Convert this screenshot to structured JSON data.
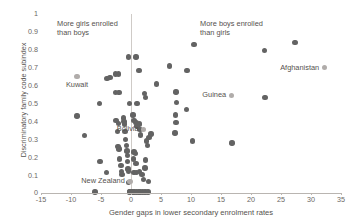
{
  "chart_data": {
    "type": "scatter",
    "title": "",
    "xlabel": "Gender gaps in lower secondary enrolment rates",
    "ylabel": "Discriminatory family code subindex",
    "xlim": [
      -15,
      35
    ],
    "ylim": [
      0,
      1
    ],
    "xticks": [
      -15,
      -10,
      -5,
      0,
      5,
      10,
      15,
      20,
      25,
      30,
      35
    ],
    "xtick_labels": [
      "-15",
      "-10",
      "-5",
      "0",
      "5",
      "10",
      "15",
      "20",
      "25",
      "30",
      "35"
    ],
    "yticks": [
      0,
      0.1,
      0.2,
      0.3,
      0.4,
      0.5,
      0.6,
      0.7,
      0.8,
      0.9,
      1
    ],
    "ytick_labels": [
      "0",
      "0.1",
      "0.2",
      "0.3",
      "0.4",
      "0.5",
      "0.6",
      "0.7",
      "0.8",
      "0.9",
      "1"
    ],
    "grid": false,
    "legend": null,
    "reference_lines": [
      {
        "name": "zero-gender-gap",
        "axis": "x",
        "value": 0
      }
    ],
    "annotations": [
      {
        "name": "more-girls-note",
        "text": "More girls enrolled\nthan boys",
        "x": -12.3,
        "y": 0.955
      },
      {
        "name": "more-boys-note",
        "text": "More boys enrolled\nthan girls",
        "x": 11.5,
        "y": 0.955
      }
    ],
    "point_color": "#636363",
    "label_point_color": "#b0acaa",
    "points": [
      {
        "x": -9.0,
        "y": 0.43
      },
      {
        "x": -7.8,
        "y": 0.32
      },
      {
        "x": -6.0,
        "y": 0.005
      },
      {
        "x": -5.3,
        "y": 0.5
      },
      {
        "x": -5.2,
        "y": 0.175
      },
      {
        "x": -4.0,
        "y": 0.64
      },
      {
        "x": -3.5,
        "y": 0.645
      },
      {
        "x": -4.1,
        "y": 0.115
      },
      {
        "x": -2.6,
        "y": 0.665
      },
      {
        "x": -2.1,
        "y": 0.665
      },
      {
        "x": -2.6,
        "y": 0.56
      },
      {
        "x": -2.0,
        "y": 0.56
      },
      {
        "x": -2.5,
        "y": 0.405
      },
      {
        "x": -2.1,
        "y": 0.39
      },
      {
        "x": -2.3,
        "y": 0.345
      },
      {
        "x": -2.2,
        "y": 0.26
      },
      {
        "x": -2.0,
        "y": 0.245
      },
      {
        "x": -1.9,
        "y": 0.19
      },
      {
        "x": -1.7,
        "y": 0.155
      },
      {
        "x": -1.6,
        "y": 0.12
      },
      {
        "x": -1.5,
        "y": 0.105
      },
      {
        "x": -1.3,
        "y": 0.42
      },
      {
        "x": -1.2,
        "y": 0.4
      },
      {
        "x": -1.1,
        "y": 0.385
      },
      {
        "x": -1.0,
        "y": 0.345
      },
      {
        "x": -0.9,
        "y": 0.3
      },
      {
        "x": -0.8,
        "y": 0.265
      },
      {
        "x": -0.7,
        "y": 0.235
      },
      {
        "x": -0.6,
        "y": 0.21
      },
      {
        "x": -0.6,
        "y": 0.175
      },
      {
        "x": -0.5,
        "y": 0.135
      },
      {
        "x": -0.4,
        "y": 0.12
      },
      {
        "x": -0.4,
        "y": 0.06
      },
      {
        "x": -0.3,
        "y": 0.005
      },
      {
        "x": -0.2,
        "y": 0.005
      },
      {
        "x": 0.0,
        "y": 0.005
      },
      {
        "x": 0.3,
        "y": 0.005
      },
      {
        "x": 0.6,
        "y": 0.005
      },
      {
        "x": 0.9,
        "y": 0.005
      },
      {
        "x": 1.2,
        "y": 0.005
      },
      {
        "x": 1.5,
        "y": 0.005
      },
      {
        "x": 1.9,
        "y": 0.005
      },
      {
        "x": 2.3,
        "y": 0.005
      },
      {
        "x": 2.8,
        "y": 0.005
      },
      {
        "x": -0.4,
        "y": 0.76
      },
      {
        "x": 0.8,
        "y": 0.76
      },
      {
        "x": -0.3,
        "y": 0.5
      },
      {
        "x": 1.0,
        "y": 0.5
      },
      {
        "x": 1.3,
        "y": 0.685
      },
      {
        "x": 0.3,
        "y": 0.435
      },
      {
        "x": 0.5,
        "y": 0.405
      },
      {
        "x": 0.8,
        "y": 0.395
      },
      {
        "x": 1.0,
        "y": 0.375
      },
      {
        "x": 1.4,
        "y": 0.385
      },
      {
        "x": 1.5,
        "y": 0.355
      },
      {
        "x": 1.6,
        "y": 0.325
      },
      {
        "x": 0.5,
        "y": 0.23
      },
      {
        "x": 0.7,
        "y": 0.22
      },
      {
        "x": 0.4,
        "y": 0.19
      },
      {
        "x": 0.8,
        "y": 0.165
      },
      {
        "x": 0.5,
        "y": 0.115
      },
      {
        "x": 0.9,
        "y": 0.115
      },
      {
        "x": 1.4,
        "y": 0.12
      },
      {
        "x": 1.8,
        "y": 0.105
      },
      {
        "x": 2.4,
        "y": 0.185
      },
      {
        "x": 2.3,
        "y": 0.14
      },
      {
        "x": 2.1,
        "y": 0.075
      },
      {
        "x": 2.9,
        "y": 0.065
      },
      {
        "x": 2.6,
        "y": 0.29
      },
      {
        "x": 2.7,
        "y": 0.265
      },
      {
        "x": 2.2,
        "y": 0.555
      },
      {
        "x": 2.4,
        "y": 0.535
      },
      {
        "x": 3.0,
        "y": 0.31
      },
      {
        "x": 3.3,
        "y": 0.33
      },
      {
        "x": 4.2,
        "y": 0.61
      },
      {
        "x": 6.4,
        "y": 0.71
      },
      {
        "x": 7.5,
        "y": 0.565
      },
      {
        "x": 7.6,
        "y": 0.505
      },
      {
        "x": 7.4,
        "y": 0.435
      },
      {
        "x": 7.5,
        "y": 0.395
      },
      {
        "x": 7.3,
        "y": 0.335
      },
      {
        "x": 9.3,
        "y": 0.685
      },
      {
        "x": 9.2,
        "y": 0.465
      },
      {
        "x": 10.2,
        "y": 0.29
      },
      {
        "x": 10.5,
        "y": 0.83
      },
      {
        "x": 16.8,
        "y": 0.28
      },
      {
        "x": 22.2,
        "y": 0.795
      },
      {
        "x": 22.3,
        "y": 0.535
      },
      {
        "x": 27.3,
        "y": 0.84
      }
    ],
    "labeled_points": [
      {
        "name": "kuwait",
        "label": "Kuwait",
        "x": -9.0,
        "y": 0.65,
        "label_pos": "below"
      },
      {
        "name": "new-zealand",
        "label": "New Zealand",
        "x": -0.2,
        "y": 0.065,
        "label_pos": "left"
      },
      {
        "name": "bolivia",
        "label": "Bolivia",
        "x": 2.1,
        "y": 0.355,
        "label_pos": "left"
      },
      {
        "name": "guinea",
        "label": "Guinea",
        "x": 16.7,
        "y": 0.545,
        "label_pos": "left"
      },
      {
        "name": "afghanistan",
        "label": "Afghanistan",
        "x": 32.2,
        "y": 0.7,
        "label_pos": "left"
      }
    ]
  }
}
